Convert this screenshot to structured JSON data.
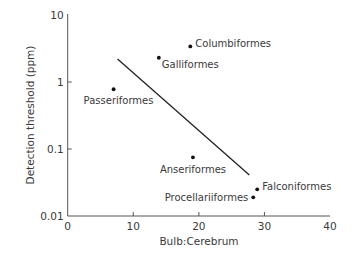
{
  "chart_data": {
    "type": "scatter",
    "title": "",
    "xlabel": "Bulb:Cerebrum",
    "ylabel": "Detection threshold (ppm)",
    "xlim": [
      0,
      40
    ],
    "ylim": [
      0.01,
      10
    ],
    "yscale": "log",
    "grid": false,
    "legend": null,
    "x_ticks": [
      0,
      10,
      20,
      30,
      40
    ],
    "x_tick_labels": [
      "0",
      "10",
      "20",
      "30",
      "40"
    ],
    "y_ticks": [
      0.01,
      0.1,
      1,
      10
    ],
    "y_tick_labels": [
      "0.01",
      "0.1",
      "1",
      "10"
    ],
    "points": [
      {
        "label": "Passeriformes",
        "x": 7.0,
        "y": 0.78,
        "label_pos": "below-left"
      },
      {
        "label": "Galliformes",
        "x": 13.9,
        "y": 2.3,
        "label_pos": "below-right"
      },
      {
        "label": "Columbiformes",
        "x": 18.7,
        "y": 3.4,
        "label_pos": "right"
      },
      {
        "label": "Anseriformes",
        "x": 19.1,
        "y": 0.075,
        "label_pos": "below"
      },
      {
        "label": "Falconiformes",
        "x": 28.9,
        "y": 0.025,
        "label_pos": "right"
      },
      {
        "label": "Procellariiformes",
        "x": 28.3,
        "y": 0.019,
        "label_pos": "left"
      }
    ],
    "regression_line": {
      "x": [
        7.6,
        27.7
      ],
      "y": [
        2.2,
        0.041
      ]
    },
    "colors": {
      "points": "#111111",
      "line": "#222222",
      "axis": "#555555",
      "text": "#3a3a3a"
    }
  }
}
